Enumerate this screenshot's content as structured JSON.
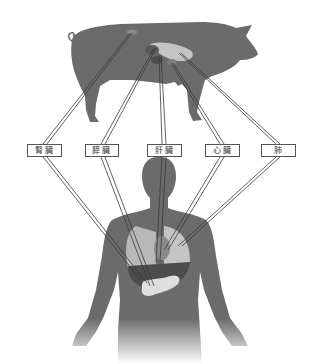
{
  "diagram": {
    "title": "",
    "colors": {
      "background": "#ffffff",
      "silhouette": "#6b6b6b",
      "organ_light": "#c9c9c9",
      "organ_dark": "#4a4a4a",
      "leader_line": "#3a3a3a",
      "label_border": "#555555"
    },
    "subjects": [
      {
        "name": "pig",
        "position": "top"
      },
      {
        "name": "human",
        "position": "bottom"
      }
    ],
    "labels": [
      {
        "id": "kidney",
        "text": "腎臓",
        "x": 27,
        "y": 144,
        "w": 35
      },
      {
        "id": "pancreas",
        "text": "膵臓",
        "x": 85,
        "y": 144,
        "w": 34
      },
      {
        "id": "liver",
        "text": "肝臓",
        "x": 147,
        "y": 144,
        "w": 35
      },
      {
        "id": "heart",
        "text": "心臓",
        "x": 205,
        "y": 144,
        "w": 35
      },
      {
        "id": "lung",
        "text": "肺",
        "x": 261,
        "y": 144,
        "w": 35
      }
    ],
    "connections": [
      {
        "label": "腎臓",
        "pig_point": [
          130,
          33
        ],
        "box_top": [
          45,
          144
        ],
        "box_bottom": [
          45,
          157
        ],
        "human_point": [
          145,
          283
        ]
      },
      {
        "label": "膵臓",
        "pig_point": [
          155,
          48
        ],
        "box_top": [
          103,
          144
        ],
        "box_bottom": [
          103,
          157
        ],
        "human_point": [
          152,
          286
        ]
      },
      {
        "label": "肝臓",
        "pig_point": [
          160,
          55
        ],
        "box_top": [
          164,
          144
        ],
        "box_bottom": [
          164,
          157
        ],
        "human_point": [
          158,
          262
        ]
      },
      {
        "label": "心臓",
        "pig_point": [
          172,
          63
        ],
        "box_top": [
          222,
          144
        ],
        "box_bottom": [
          222,
          157
        ],
        "human_point": [
          166,
          250
        ]
      },
      {
        "label": "肺",
        "pig_point": [
          180,
          53
        ],
        "box_top": [
          278,
          144
        ],
        "box_bottom": [
          278,
          157
        ],
        "human_point": [
          180,
          246
        ]
      }
    ]
  }
}
